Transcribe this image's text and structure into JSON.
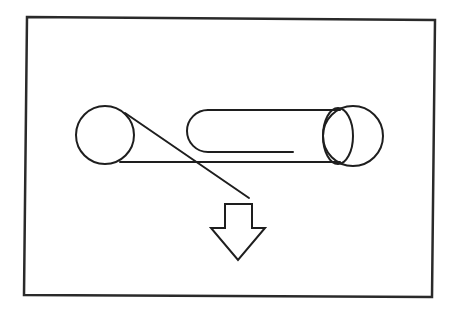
{
  "diagram": {
    "type": "belt-pulley-schematic",
    "colors": {
      "stroke": "#1e1e1e",
      "background": "#ffffff"
    },
    "frame": {
      "points": "27,17 435,20 432,297 24,295"
    },
    "left_pulley": {
      "cx": 105,
      "cy": 135,
      "r": 29
    },
    "right_pulley": {
      "cx": 353,
      "cy": 136,
      "r": 30
    },
    "cylinder_end_ellipse": {
      "cx": 338,
      "cy": 136,
      "rx": 15,
      "ry": 28
    },
    "cylinder_body": {
      "top_line": {
        "x1": 208,
        "y1": 110,
        "x2": 340,
        "y2": 110
      },
      "bottom_line": {
        "x1": 120,
        "y1": 162,
        "x2": 340,
        "y2": 162
      }
    },
    "inner_loop": {
      "path": "M 293 152 L 208 152 A 21 21 0 0 1 187 131 A 21 21 0 0 1 208 110"
    },
    "diagonal_strand": {
      "x1": 125,
      "y1": 113,
      "x2": 249,
      "y2": 198
    },
    "output_arrow": {
      "direction": "down",
      "points": "225,204 252,204 252,228 265,228 238,260 211,228 225,228"
    }
  }
}
